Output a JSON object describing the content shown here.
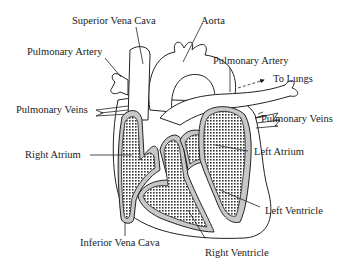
{
  "diagram": {
    "title": "",
    "type": "anatomical heart cross-section",
    "colors": {
      "line": "#222222",
      "wall_fill": "#c8c8c8",
      "chamber_fill": "#9a9a9a",
      "background": "#ffffff"
    },
    "labels": {
      "superior_vena_cava": "Superior Vena Cava",
      "aorta": "Aorta",
      "pulmonary_artery_left": "Pulmonary Artery",
      "pulmonary_artery_right": "Pulmonary Artery",
      "to_lungs": "To Lungs",
      "pulmonary_veins_left": "Pulmonary Veins",
      "pulmonary_veins_right": "Pulmonary Veins",
      "right_atrium": "Right Atrium",
      "left_atrium": "Left Atrium",
      "left_ventricle": "Left Ventricle",
      "inferior_vena_cava": "Inferior Vena Cava",
      "right_ventricle": "Right Ventricle"
    }
  }
}
